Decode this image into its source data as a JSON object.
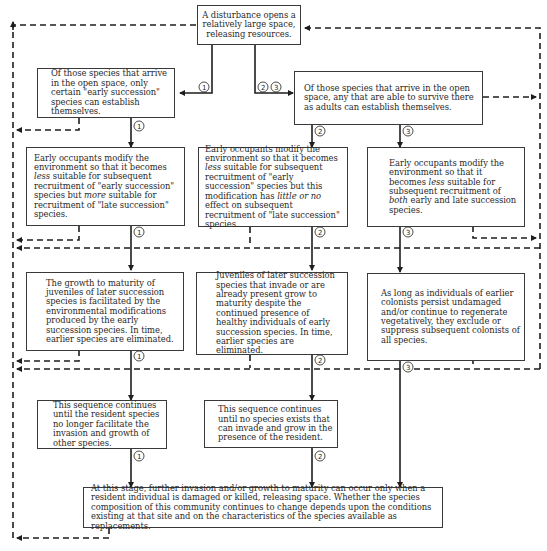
{
  "colors": {
    "line": "#1e1e1e",
    "dashed": "#1e1e1e",
    "box_border": "#3a3a3a",
    "text": "#2a2a2a",
    "background": "#ffffff"
  },
  "boxes": {
    "start": {
      "text": "A disturbance opens a relatively large space, releasing resources."
    },
    "arrival_early": {
      "text": "Of those species that arrive in the open space, only certain \"early succession\" species can establish themselves."
    },
    "arrival_any": {
      "text": "Of those species that arrive in the open space, any that are able to survive there as adults can establish themselves."
    },
    "modify_1": {
      "parts": [
        "Early occupants modify the environment so that it becomes ",
        "less",
        " suitable for subsequent recruitment of \"early succession\" species but ",
        "more",
        " suitable for recruitment of \"late succession\" species."
      ]
    },
    "modify_2": {
      "parts": [
        "Early occupants modify the environment so that it becomes ",
        "less",
        " suitable for subsequent recruitment of \"early succession\" species but this modification has ",
        "little or no",
        " effect on subsequent recruitment of \"late succession\" species."
      ]
    },
    "modify_3": {
      "parts": [
        "Early occupants modify the environment so that it becomes ",
        "less",
        " suitable for subsequent recruitment of ",
        "both",
        " early and late succession species."
      ]
    },
    "growth_1": {
      "text": "The growth to maturity of juveniles of later succession species is facilitated by the environmental modifications produced by the early succession species. In time, earlier species are eliminated."
    },
    "growth_2": {
      "text": "Juveniles of later succession species that invade or are already present grow to maturity despite the continued presence of healthy individuals of early succession species. In time, earlier species are eliminated."
    },
    "growth_3": {
      "text": "As long as individuals of earlier colonists persist undamaged and/or continue to regenerate vegetatively, they exclude or suppress subsequent colonists of all species."
    },
    "sequence_1": {
      "text": "This sequence continues until the resident species no longer facilitate the invasion and growth of other species."
    },
    "sequence_2": {
      "text": "This sequence continues until no species exists that can invade and grow in the presence of the resident."
    },
    "final": {
      "text": "At this stage, further invasion and/or growth to maturity can occur only when a resident individual is damaged or killed, releasing space. Whether the species composition of this community continues to change depends upon the conditions existing at that site and on the characteristics of the species available as replacements."
    }
  },
  "pathway_labels": {
    "one": "1",
    "two": "2",
    "three": "3"
  }
}
